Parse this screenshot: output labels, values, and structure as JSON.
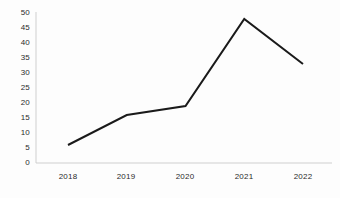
{
  "chart_data": {
    "type": "line",
    "title": "",
    "subtitle": "",
    "xlabel": "",
    "ylabel": "",
    "categories": [
      "2018",
      "2019",
      "2020",
      "2021",
      "2022"
    ],
    "values": [
      6,
      16,
      19,
      48,
      33
    ],
    "series": [
      {
        "name": "",
        "values": [
          6,
          16,
          19,
          48,
          33
        ]
      }
    ],
    "x_tick_labels": [
      "2018",
      "2019",
      "2020",
      "2021",
      "2022"
    ],
    "y_tick_labels": [
      "0",
      "5",
      "10",
      "15",
      "20",
      "25",
      "30",
      "35",
      "40",
      "45",
      "50"
    ],
    "y_tick_values": [
      0,
      5,
      10,
      15,
      20,
      25,
      30,
      35,
      40,
      45,
      50
    ],
    "ylim": [
      0,
      50
    ],
    "xlim": [
      2018,
      2022
    ],
    "grid": false,
    "legend": false,
    "legend_position": "none",
    "markers": false,
    "annotations": [],
    "colors": {
      "line": "#1a1a1a",
      "axis": "#c9c9c9",
      "text": "#2b2b2b",
      "background": "#fdfdfd"
    },
    "line_width": 2
  }
}
